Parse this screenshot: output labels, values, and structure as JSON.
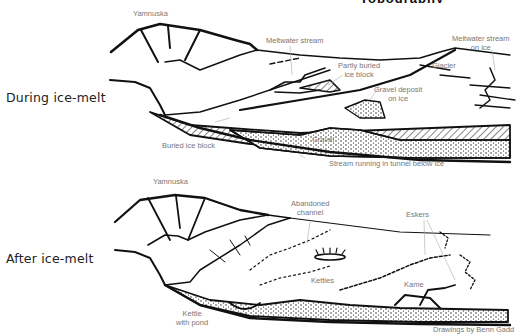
{
  "header": {
    "title_fragment": "Topography"
  },
  "panels": {
    "during": {
      "label": "During ice-melt",
      "annotations": {
        "yamnuska": "Yamnuska",
        "meltwater_stream": "Meltwater stream",
        "meltwater_on_ice_1": "Meltwater stream",
        "meltwater_on_ice_2": "on ice",
        "partly_buried_1": "Partly buried",
        "partly_buried_2": "ice block",
        "glacier": "Glacier",
        "gravel_deposit_1": "Gravel deposit",
        "gravel_deposit_2": "on ice",
        "buried_ice_block": "Buried ice block",
        "gravel": "Gravel",
        "stream_tunnel": "Stream running in tunnel below ice"
      }
    },
    "after": {
      "label": "After ice-melt",
      "annotations": {
        "yamnuska": "Yamnuska",
        "abandoned_1": "Abandoned",
        "abandoned_2": "channel",
        "eskers": "Eskers",
        "kettles": "Kettles",
        "kame": "Kame",
        "kettle_pond_1": "Kettle",
        "kettle_pond_2": "with pond"
      }
    }
  },
  "credit": "Drawings by Benn Gadd",
  "colors": {
    "ink": "#111111",
    "label": "#777777",
    "leader": "#aaaaaa"
  }
}
